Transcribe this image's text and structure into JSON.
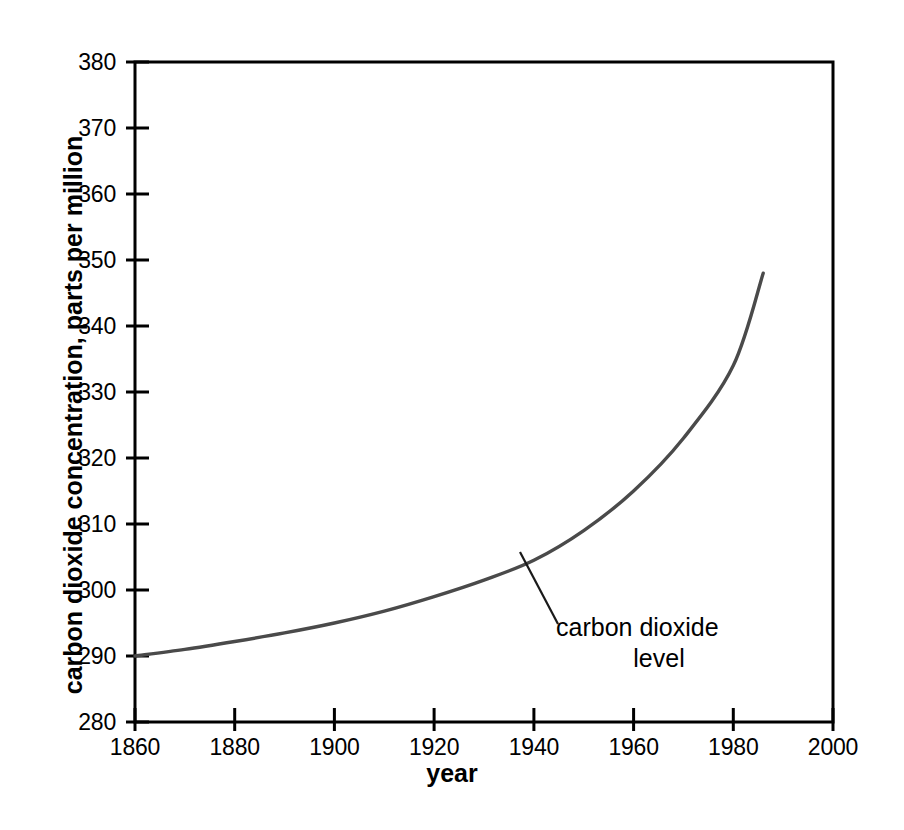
{
  "chart_data": {
    "type": "line",
    "title": "",
    "xlabel": "year",
    "ylabel": "carbon dioxide concentration, parts per million",
    "xlim": [
      1860,
      2000
    ],
    "ylim": [
      280,
      380
    ],
    "xticks": [
      1860,
      1880,
      1900,
      1920,
      1940,
      1960,
      1980,
      2000
    ],
    "yticks": [
      280,
      290,
      300,
      310,
      320,
      330,
      340,
      350,
      360,
      370,
      380
    ],
    "grid": false,
    "legend": null,
    "series": [
      {
        "name": "carbon dioxide level",
        "color": "#4a4a4a",
        "x": [
          1860,
          1870,
          1880,
          1890,
          1900,
          1910,
          1920,
          1930,
          1940,
          1950,
          1960,
          1970,
          1980,
          1986
        ],
        "values": [
          290.0,
          291.0,
          292.2,
          293.5,
          295.0,
          296.8,
          299.0,
          301.5,
          304.5,
          309.0,
          315.0,
          323.0,
          334.0,
          348.0
        ]
      }
    ],
    "annotations": [
      {
        "text_lines": [
          "carbon dioxide",
          "level"
        ],
        "points_to_year": 1931,
        "points_to_value": 306.0
      }
    ]
  },
  "axes": {
    "y_tick_labels": [
      "380",
      "370",
      "360",
      "350",
      "340",
      "330",
      "320",
      "310",
      "300",
      "290",
      "280"
    ],
    "x_tick_labels": [
      "1860",
      "1880",
      "1900",
      "1920",
      "1940",
      "1960",
      "1980",
      "2000"
    ],
    "x_title": "year",
    "y_title": "carbon dioxide concentration, parts per million"
  },
  "annotation": {
    "line_1": "carbon dioxide",
    "line_2": "level"
  },
  "style": {
    "axis_color": "#000000",
    "curve_color": "#4a4a4a",
    "leader_color": "#1a1a1a",
    "background": "#ffffff"
  }
}
